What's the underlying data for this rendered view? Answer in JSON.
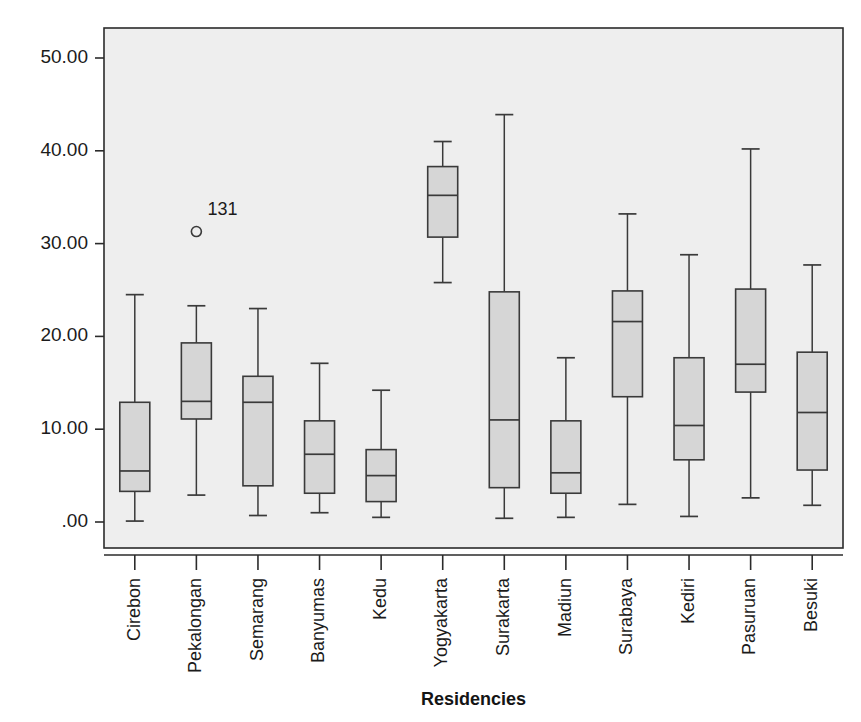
{
  "chart_data": {
    "type": "box",
    "title": "",
    "subtitle": "",
    "xlabel": "Residencies",
    "ylabel": "",
    "ylim": [
      -2.8,
      54.0
    ],
    "grid": false,
    "legend": null,
    "y_ticks": [
      {
        "value": 0,
        "label": ".00"
      },
      {
        "value": 10,
        "label": "10.00"
      },
      {
        "value": 20,
        "label": "20.00"
      },
      {
        "value": 30,
        "label": "30.00"
      },
      {
        "value": 40,
        "label": "40.00"
      },
      {
        "value": 50,
        "label": "50.00"
      }
    ],
    "categories": [
      "Cirebon",
      "Pekalongan",
      "Semarang",
      "Banyumas",
      "Kedu",
      "Yogyakarta",
      "Surakarta",
      "Madiun",
      "Surabaya",
      "Kediri",
      "Pasuruan",
      "Besuki"
    ],
    "boxes": [
      {
        "category": "Cirebon",
        "whisker_low": 0.1,
        "q1": 3.3,
        "median": 5.5,
        "q3": 12.9,
        "whisker_high": 24.5,
        "outliers": []
      },
      {
        "category": "Pekalongan",
        "whisker_low": 2.9,
        "q1": 11.1,
        "median": 13.0,
        "q3": 19.3,
        "whisker_high": 23.3,
        "outliers": [
          {
            "value": 31.3,
            "label": "131"
          }
        ]
      },
      {
        "category": "Semarang",
        "whisker_low": 0.7,
        "q1": 3.9,
        "median": 12.9,
        "q3": 15.7,
        "whisker_high": 23.0,
        "outliers": []
      },
      {
        "category": "Banyumas",
        "whisker_low": 1.0,
        "q1": 3.1,
        "median": 7.3,
        "q3": 10.9,
        "whisker_high": 17.1,
        "outliers": []
      },
      {
        "category": "Kedu",
        "whisker_low": 0.5,
        "q1": 2.2,
        "median": 5.0,
        "q3": 7.8,
        "whisker_high": 14.2,
        "outliers": []
      },
      {
        "category": "Yogyakarta",
        "whisker_low": 25.8,
        "q1": 30.7,
        "median": 35.2,
        "q3": 38.3,
        "whisker_high": 41.0,
        "outliers": []
      },
      {
        "category": "Surakarta",
        "whisker_low": 0.4,
        "q1": 3.7,
        "median": 11.0,
        "q3": 24.8,
        "whisker_high": 43.9,
        "outliers": []
      },
      {
        "category": "Madiun",
        "whisker_low": 0.5,
        "q1": 3.1,
        "median": 5.3,
        "q3": 10.9,
        "whisker_high": 17.7,
        "outliers": []
      },
      {
        "category": "Surabaya",
        "whisker_low": 1.9,
        "q1": 13.5,
        "median": 21.6,
        "q3": 24.9,
        "whisker_high": 33.2,
        "outliers": []
      },
      {
        "category": "Kediri",
        "whisker_low": 0.6,
        "q1": 6.7,
        "median": 10.4,
        "q3": 17.7,
        "whisker_high": 28.8,
        "outliers": []
      },
      {
        "category": "Pasuruan",
        "whisker_low": 2.6,
        "q1": 14.0,
        "median": 17.0,
        "q3": 25.1,
        "whisker_high": 40.2,
        "outliers": []
      },
      {
        "category": "Besuki",
        "whisker_low": 1.8,
        "q1": 5.6,
        "median": 11.8,
        "q3": 18.3,
        "whisker_high": 27.7,
        "outliers": []
      }
    ],
    "colors": {
      "plot_background": "#eeeeee",
      "page_background": "#ffffff",
      "box_fill": "#d6d6d6",
      "box_stroke": "#3a3a3a",
      "whisker_stroke": "#3a3a3a",
      "axis_stroke": "#2b2b2b",
      "text": "#1b1b1b"
    },
    "geometry": {
      "plot_left": 104,
      "plot_right": 843,
      "plot_top": 28,
      "plot_bottom": 548,
      "y_zero_px": 522,
      "y_fifty_px": 58,
      "box_width": 30
    }
  }
}
